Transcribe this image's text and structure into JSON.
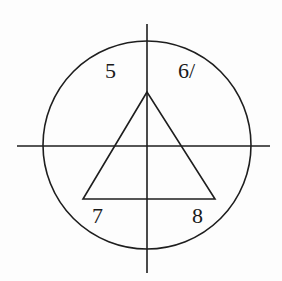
{
  "diagram": {
    "stroke_color": "#1e1e1e",
    "background": "#fdfdfd",
    "circle": {
      "cx": 147,
      "cy": 145,
      "r": 104
    },
    "vertical_axis": {
      "x": 147,
      "y1": 24,
      "y2": 273
    },
    "horizontal_axis": {
      "y": 146,
      "x1": 17,
      "x2": 270
    },
    "triangle": {
      "apex": [
        147,
        92
      ],
      "base_left": [
        83,
        199
      ],
      "base_right": [
        215,
        199
      ]
    },
    "labels": [
      {
        "id": "5",
        "text": "5",
        "x": 105,
        "y": 60
      },
      {
        "id": "6",
        "text": "6/",
        "x": 178,
        "y": 60
      },
      {
        "id": "7",
        "text": "7",
        "x": 92,
        "y": 205
      },
      {
        "id": "8",
        "text": "8",
        "x": 192,
        "y": 205
      }
    ]
  }
}
